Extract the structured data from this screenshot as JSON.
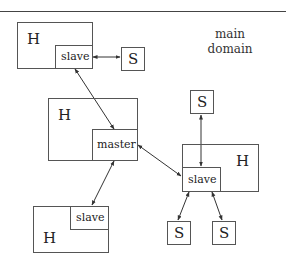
{
  "diagram": {
    "caption_line1": "main",
    "caption_line2": "domain",
    "host_label": "H",
    "slave_label": "slave",
    "master_label": "master",
    "sensor_label": "S",
    "nodes": [
      {
        "id": "host-top-left",
        "type": "H",
        "child": "slave"
      },
      {
        "id": "sensor-top",
        "type": "S"
      },
      {
        "id": "host-center",
        "type": "H",
        "child": "master"
      },
      {
        "id": "sensor-right-top",
        "type": "S"
      },
      {
        "id": "host-right",
        "type": "H",
        "child": "slave"
      },
      {
        "id": "host-bottom-left",
        "type": "H",
        "child": "slave"
      },
      {
        "id": "sensor-bottom-1",
        "type": "S"
      },
      {
        "id": "sensor-bottom-2",
        "type": "S"
      }
    ],
    "edges": [
      {
        "from": "slave(host-top-left)",
        "to": "sensor-top",
        "bidirectional": true
      },
      {
        "from": "slave(host-top-left)",
        "to": "master",
        "bidirectional": true
      },
      {
        "from": "master",
        "to": "slave(host-bottom-left)",
        "bidirectional": true
      },
      {
        "from": "master",
        "to": "slave(host-right)",
        "bidirectional": true
      },
      {
        "from": "sensor-right-top",
        "to": "slave(host-right)",
        "bidirectional": true
      },
      {
        "from": "slave(host-right)",
        "to": "sensor-bottom-1",
        "bidirectional": true
      },
      {
        "from": "slave(host-right)",
        "to": "sensor-bottom-2",
        "bidirectional": true
      }
    ]
  }
}
